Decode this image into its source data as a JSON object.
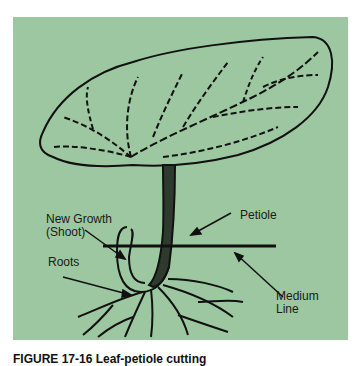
{
  "figure": {
    "background_color": "#9cc7a0",
    "labels": {
      "new_growth": "New Growth",
      "shoot": "(Shoot)",
      "petiole": "Petiole",
      "roots": "Roots",
      "medium": "Medium",
      "line": "Line"
    },
    "caption": "FIGURE 17-16 Leaf-petiole cutting"
  }
}
